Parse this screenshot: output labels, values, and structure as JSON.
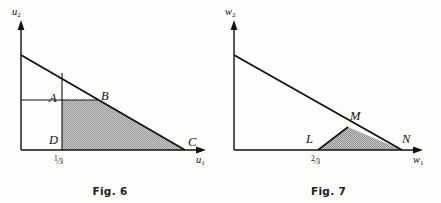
{
  "figures": [
    {
      "id": "fig6",
      "caption": "Fig. 6",
      "axes": {
        "y_label": "u",
        "y_sub": "2",
        "x_label": "u",
        "x_sub": "1"
      },
      "tick": {
        "value": "1/3",
        "numerator": "1",
        "denominator": "3"
      },
      "points": [
        {
          "name": "A",
          "label": "A"
        },
        {
          "name": "B",
          "label": "B"
        },
        {
          "name": "C",
          "label": "C"
        },
        {
          "name": "D",
          "label": "D"
        }
      ],
      "shaded_region": "trapezoid D-B-C bounded below by u1-axis, left by vertical line at 1/3, above by horizontal line through A and B, and right by the budget line",
      "colors": {
        "line": "#111111",
        "shade_fill": "#b9b9b9",
        "background": "#fdfdfc"
      },
      "geometry": {
        "origin": [
          21,
          150
        ],
        "y_axis_top": [
          21,
          22
        ],
        "x_axis_right": [
          205,
          150
        ],
        "budget_line": [
          [
            21,
            55
          ],
          [
            185,
            150
          ]
        ],
        "vertical_line_x": 62,
        "horizontal_line_y": 100,
        "A": [
          62,
          100
        ],
        "B": [
          98,
          100
        ],
        "C": [
          185,
          150
        ],
        "D": [
          62,
          150
        ]
      }
    },
    {
      "id": "fig7",
      "caption": "Fig. 7",
      "axes": {
        "y_label": "w",
        "y_sub": "2",
        "x_label": "w",
        "x_sub": "1"
      },
      "tick": {
        "value": "2/3",
        "numerator": "2",
        "denominator": "3"
      },
      "points": [
        {
          "name": "L",
          "label": "L"
        },
        {
          "name": "M",
          "label": "M"
        },
        {
          "name": "N",
          "label": "N"
        }
      ],
      "shaded_region": "triangle L-M-N bounded below by w1-axis, upper-right by the budget line, and left by segment LM",
      "colors": {
        "line": "#111111",
        "shade_fill": "#b9b9b9",
        "background": "#fdfdfc"
      },
      "geometry": {
        "origin": [
          18,
          150
        ],
        "y_axis_top": [
          18,
          22
        ],
        "x_axis_right": [
          206,
          150
        ],
        "budget_line": [
          [
            18,
            55
          ],
          [
            186,
            150
          ]
        ],
        "L": [
          102,
          150
        ],
        "M": [
          132,
          127
        ],
        "N": [
          186,
          150
        ]
      }
    }
  ]
}
